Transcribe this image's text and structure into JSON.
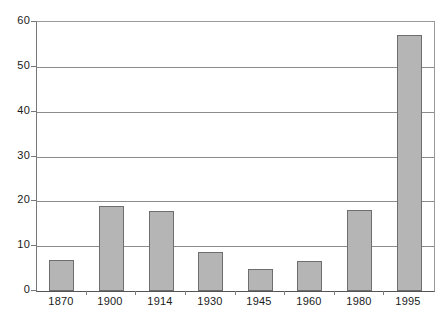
{
  "chart_data": {
    "type": "bar",
    "title": "",
    "xlabel": "",
    "ylabel": "",
    "categories": [
      "1870",
      "1900",
      "1914",
      "1930",
      "1945",
      "1960",
      "1980",
      "1995"
    ],
    "values": [
      7,
      19,
      17.8,
      8.7,
      5,
      6.6,
      18,
      57
    ],
    "ylim": [
      0,
      60
    ],
    "yticks": [
      0,
      10,
      20,
      30,
      40,
      50,
      60
    ],
    "ytick_labels": [
      "0",
      "10",
      "20",
      "30",
      "40",
      "50",
      "60"
    ],
    "grid": true,
    "legend": false,
    "legend_position": "none",
    "bar_color": "#b5b5b5",
    "bar_border_color": "#6e6e6e",
    "gridline_color": "#8c8c8c",
    "axis_color": "#555555",
    "background_color": "#ffffff",
    "text_color": "#1a1a1a"
  }
}
